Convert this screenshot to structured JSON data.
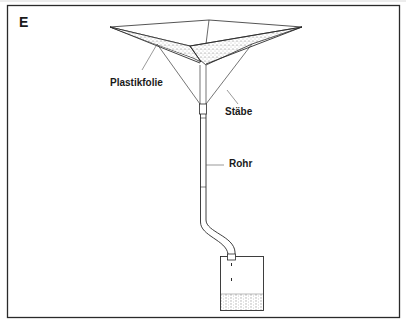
{
  "figure": {
    "panel_letter": "E",
    "labels": {
      "plastic_sheet": "Plastikfolie",
      "rods": "Stäbe",
      "pipe": "Rohr"
    }
  },
  "colors": {
    "ink": "#1a1a1a",
    "stipple": "#8a8a8a",
    "background": "#ffffff"
  }
}
